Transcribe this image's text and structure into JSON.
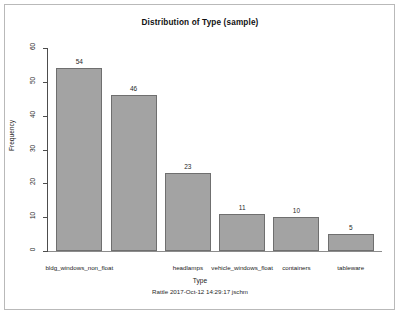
{
  "figure": {
    "title": "Distribution of Type (sample)",
    "x_axis_title": "Type",
    "y_axis_title": "Frequency",
    "caption": "Rattle 2017-Oct-12 14:29:17 jschm",
    "bar_fill_color": "#a3a3a3",
    "bar_border_color": "#6f6f6f",
    "background_color": "#ffffff",
    "frame_color": "#b9b9b9"
  },
  "chart_data": {
    "type": "bar",
    "title": "Distribution of Type (sample)",
    "xlabel": "Type",
    "ylabel": "Frequency",
    "categories": [
      "bldg_windows_non_float",
      "bldg_windows_float",
      "headlamps",
      "vehicle_windows_float",
      "containers",
      "tableware"
    ],
    "visible_tick_labels": [
      "bldg_windows_non_float",
      "",
      "headlamps",
      "vehicle_windows_float",
      "containers",
      "tableware"
    ],
    "values": [
      54,
      46,
      23,
      11,
      10,
      5
    ],
    "data_labels": [
      "54",
      "46",
      "23",
      "11",
      "10",
      "5"
    ],
    "ylim": [
      0,
      60
    ],
    "yticks": [
      0,
      10,
      20,
      30,
      40,
      50,
      60
    ],
    "ytick_labels": [
      "0",
      "10",
      "20",
      "30",
      "40",
      "50",
      "60"
    ],
    "grid": false,
    "legend": false,
    "caption": "Rattle 2017-Oct-12 14:29:17 jschm"
  }
}
